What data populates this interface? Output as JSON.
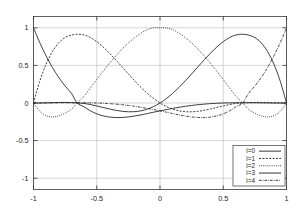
{
  "chart_data": {
    "type": "line",
    "title": "",
    "xlabel": "",
    "ylabel": "",
    "xlim": [
      -1,
      1
    ],
    "ylim": [
      -1.15,
      1.15
    ],
    "grid": true,
    "legend_position": "bottom-right",
    "xticks": [
      {
        "value": -1,
        "label": "-1"
      },
      {
        "value": -0.5,
        "label": "-0.5"
      },
      {
        "value": 0,
        "label": "0"
      },
      {
        "value": 0.5,
        "label": "0.5"
      },
      {
        "value": 1,
        "label": "1"
      }
    ],
    "yticks": [
      {
        "value": 1,
        "label": "1"
      },
      {
        "value": 0.5,
        "label": "0.5"
      },
      {
        "value": 0,
        "label": "0"
      },
      {
        "value": -0.5,
        "label": "-0.5"
      },
      {
        "value": -1,
        "label": "-1"
      }
    ],
    "nodes": [
      -1,
      -0.6545,
      0,
      0.6545,
      1
    ],
    "series": [
      {
        "name": "i=0",
        "label": "i=0",
        "dash": "none",
        "color": "#1d1d1d",
        "x": [
          -1,
          -0.95,
          -0.9,
          -0.85,
          -0.8,
          -0.75,
          -0.7,
          -0.6545,
          -0.6,
          -0.55,
          -0.5,
          -0.45,
          -0.4,
          -0.35,
          -0.3,
          -0.25,
          -0.2,
          -0.15,
          -0.1,
          -0.05,
          0,
          0.05,
          0.1,
          0.15,
          0.2,
          0.25,
          0.3,
          0.35,
          0.4,
          0.45,
          0.5,
          0.55,
          0.6,
          0.6545,
          0.7,
          0.75,
          0.8,
          0.85,
          0.9,
          0.95,
          1
        ],
        "y": [
          1.0,
          0.8005,
          0.6248,
          0.4713,
          0.3385,
          0.2249,
          0.1288,
          0.0,
          -0.0511,
          -0.1047,
          -0.1441,
          -0.171,
          -0.1871,
          -0.1938,
          -0.1927,
          -0.1854,
          -0.1733,
          -0.1578,
          -0.1403,
          -0.1221,
          -0.1045,
          -0.0876,
          -0.0718,
          -0.0572,
          -0.0441,
          -0.0326,
          -0.0228,
          -0.0147,
          -0.0083,
          -0.0035,
          0.0,
          0.0022,
          0.0033,
          0.0036,
          0.0034,
          0.0026,
          0.0016,
          0.0006,
          0.0,
          0.0,
          0.0
        ]
      },
      {
        "name": "i=1",
        "label": "i=1",
        "dash": "2,1.4",
        "color": "#1d1d1d",
        "x": [
          -1,
          -0.95,
          -0.9,
          -0.85,
          -0.8,
          -0.75,
          -0.7,
          -0.6545,
          -0.6,
          -0.55,
          -0.5,
          -0.45,
          -0.4,
          -0.35,
          -0.3,
          -0.25,
          -0.2,
          -0.15,
          -0.1,
          -0.05,
          0,
          0.05,
          0.1,
          0.15,
          0.2,
          0.25,
          0.3,
          0.35,
          0.4,
          0.45,
          0.5,
          0.55,
          0.6,
          0.6545,
          0.7,
          0.75,
          0.8,
          0.85,
          0.9,
          0.95,
          1
        ],
        "y": [
          0.0,
          0.2926,
          0.5185,
          0.6852,
          0.8,
          0.8701,
          0.9028,
          0.9146,
          0.9046,
          0.8702,
          0.8157,
          0.7455,
          0.6637,
          0.5742,
          0.4806,
          0.3863,
          0.2944,
          0.2076,
          0.1283,
          0.0586,
          0.0,
          -0.0466,
          -0.0811,
          -0.1037,
          -0.1152,
          -0.1168,
          -0.1101,
          -0.0969,
          -0.0793,
          -0.0594,
          -0.0393,
          -0.0208,
          -0.0057,
          0.0,
          0.0046,
          0.0075,
          0.0073,
          0.0052,
          0.0025,
          0.0005,
          0.0
        ]
      },
      {
        "name": "i=2",
        "label": "i=2",
        "dash": "0.9,1.2",
        "color": "#1d1d1d",
        "x": [
          -1,
          -0.95,
          -0.9,
          -0.85,
          -0.8,
          -0.75,
          -0.7,
          -0.6545,
          -0.6,
          -0.55,
          -0.5,
          -0.45,
          -0.4,
          -0.35,
          -0.3,
          -0.25,
          -0.2,
          -0.15,
          -0.1,
          -0.05,
          0,
          0.05,
          0.1,
          0.15,
          0.2,
          0.25,
          0.3,
          0.35,
          0.4,
          0.45,
          0.5,
          0.55,
          0.6,
          0.6545,
          0.7,
          0.75,
          0.8,
          0.85,
          0.9,
          0.95,
          1
        ],
        "y": [
          0.0,
          -0.1107,
          -0.1688,
          -0.1857,
          -0.1713,
          -0.1346,
          -0.0835,
          0.0,
          0.0915,
          0.2016,
          0.3122,
          0.4208,
          0.5255,
          0.6244,
          0.7158,
          0.798,
          0.8694,
          0.9287,
          0.9746,
          1.0,
          1.0,
          0.9974,
          0.9746,
          0.9287,
          0.8694,
          0.798,
          0.7158,
          0.6244,
          0.5255,
          0.4208,
          0.3122,
          0.2016,
          0.0915,
          0.0,
          -0.0835,
          -0.1346,
          -0.1713,
          -0.1857,
          -0.1688,
          -0.1107,
          0.0
        ]
      },
      {
        "name": "i=3",
        "label": "i=3",
        "dash": "none",
        "color": "#5a5a5a",
        "x": [
          -1,
          -0.95,
          -0.9,
          -0.85,
          -0.8,
          -0.75,
          -0.7,
          -0.6545,
          -0.6,
          -0.55,
          -0.5,
          -0.45,
          -0.4,
          -0.35,
          -0.3,
          -0.25,
          -0.2,
          -0.15,
          -0.1,
          -0.05,
          0,
          0.05,
          0.1,
          0.15,
          0.2,
          0.25,
          0.3,
          0.35,
          0.4,
          0.45,
          0.5,
          0.55,
          0.6,
          0.6545,
          0.7,
          0.75,
          0.8,
          0.85,
          0.9,
          0.95,
          1
        ],
        "y": [
          0.0,
          0.0005,
          0.0025,
          0.0052,
          0.0073,
          0.0075,
          0.0046,
          0.0,
          -0.0057,
          -0.0208,
          -0.0393,
          -0.0594,
          -0.0793,
          -0.0969,
          -0.1101,
          -0.1168,
          -0.1152,
          -0.1037,
          -0.0811,
          -0.0466,
          0.0,
          0.0586,
          0.1283,
          0.2076,
          0.2944,
          0.3863,
          0.4806,
          0.5742,
          0.6637,
          0.7455,
          0.8157,
          0.8702,
          0.9046,
          0.9146,
          0.9028,
          0.8701,
          0.8,
          0.6852,
          0.5185,
          0.2926,
          0.0
        ]
      },
      {
        "name": "i=4",
        "label": "i=4",
        "dash": "2.6,1.1,0.7,1.1",
        "color": "#1d1d1d",
        "x": [
          -1,
          -0.95,
          -0.9,
          -0.85,
          -0.8,
          -0.75,
          -0.7,
          -0.6545,
          -0.6,
          -0.55,
          -0.5,
          -0.45,
          -0.4,
          -0.35,
          -0.3,
          -0.25,
          -0.2,
          -0.15,
          -0.1,
          -0.05,
          0,
          0.05,
          0.1,
          0.15,
          0.2,
          0.25,
          0.3,
          0.35,
          0.4,
          0.45,
          0.5,
          0.55,
          0.6,
          0.6545,
          0.7,
          0.75,
          0.8,
          0.85,
          0.9,
          0.95,
          1
        ],
        "y": [
          0.0,
          0.0,
          0.0,
          0.0006,
          0.0016,
          0.0026,
          0.0034,
          0.0036,
          0.0033,
          0.0022,
          0.0,
          -0.0035,
          -0.0083,
          -0.0147,
          -0.0228,
          -0.0326,
          -0.0441,
          -0.0572,
          -0.0718,
          -0.0876,
          -0.1045,
          -0.1221,
          -0.1403,
          -0.1578,
          -0.1733,
          -0.1854,
          -0.1927,
          -0.1938,
          -0.1871,
          -0.171,
          -0.1441,
          -0.1047,
          -0.0511,
          0.0,
          0.1288,
          0.2249,
          0.3385,
          0.4713,
          0.6248,
          0.8005,
          1.0
        ]
      }
    ]
  },
  "legend": {
    "entries": [
      {
        "label": "i=0"
      },
      {
        "label": "i=1"
      },
      {
        "label": "i=2"
      },
      {
        "label": "i=3"
      },
      {
        "label": "i=4"
      }
    ]
  }
}
